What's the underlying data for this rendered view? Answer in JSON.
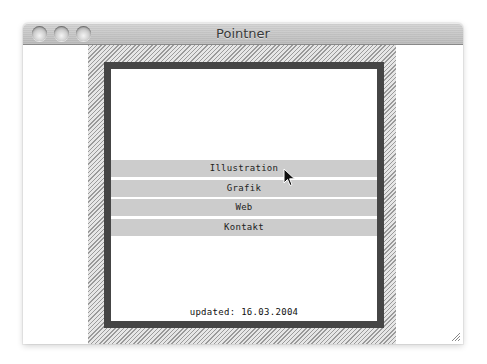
{
  "window": {
    "title": "Pointner",
    "controls": [
      "close",
      "minimize",
      "zoom"
    ]
  },
  "menu": {
    "items": [
      {
        "label": "Illustration"
      },
      {
        "label": "Grafik"
      },
      {
        "label": "Web"
      },
      {
        "label": "Kontakt"
      }
    ]
  },
  "footer": {
    "updated": "updated: 16.03.2004"
  },
  "colors": {
    "frame": "#454545",
    "menu_bar": "#cccccc",
    "hatch_dark": "#9a9a9a",
    "hatch_light": "#e6e6e6"
  }
}
